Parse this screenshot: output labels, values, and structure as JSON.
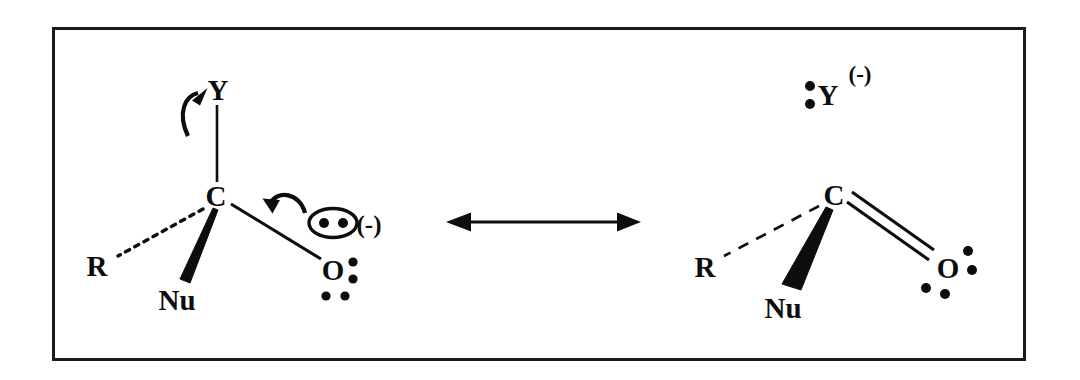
{
  "figure": {
    "background_color": "#ffffff",
    "ink_color": "#0d0d0d",
    "frame": {
      "name": "figure-border",
      "x": 52,
      "y": 27,
      "width": 974,
      "height": 334,
      "stroke_color": "#1a1a1a"
    },
    "resonance_arrow": {
      "name": "resonance-double-arrow",
      "symbol": "double-headed-arrow",
      "x1": 446,
      "y1": 222,
      "x2": 640,
      "y2": 222
    },
    "structures": [
      {
        "id": "left",
        "name": "tetrahedral-intermediate",
        "atoms": [
          {
            "label": "Y",
            "name": "atom-y",
            "x": 218,
            "y": 92
          },
          {
            "label": "C",
            "name": "atom-c",
            "x": 216,
            "y": 198
          },
          {
            "label": "R",
            "name": "atom-r",
            "x": 97,
            "y": 266
          },
          {
            "label": "Nu",
            "name": "atom-nu",
            "x": 177,
            "y": 300
          },
          {
            "label": "O",
            "name": "atom-o",
            "x": 333,
            "y": 270
          }
        ],
        "charges": [
          {
            "label": "(-)",
            "name": "charge-negative-lone-pair",
            "x": 369,
            "y": 232
          }
        ],
        "bonds": [
          {
            "name": "bond-c-y",
            "type": "plain",
            "from": "C",
            "to": "Y"
          },
          {
            "name": "bond-c-r",
            "type": "dotted",
            "from": "C",
            "to": "R"
          },
          {
            "name": "bond-c-nu",
            "type": "wedge",
            "from": "C",
            "to": "Nu"
          },
          {
            "name": "bond-c-o",
            "type": "plain",
            "from": "C",
            "to": "O"
          }
        ],
        "lone_pairs": [
          {
            "name": "lone-pair-o-right",
            "on": "O",
            "position": "right",
            "dots": 2
          },
          {
            "name": "lone-pair-o-below",
            "on": "O",
            "position": "below",
            "dots": 2
          },
          {
            "name": "lone-pair-circled",
            "on": "O",
            "position": "upper-right-circled",
            "dots": 2,
            "circled": true
          }
        ],
        "curved_arrows": [
          {
            "name": "curved-arrow-o-to-c",
            "from": "circled-lone-pair",
            "to": "c-o-bond",
            "direction": "down-left"
          },
          {
            "name": "curved-arrow-c-to-y",
            "from": "c-y-bond",
            "to": "y-leaving-group",
            "direction": "up-right"
          }
        ]
      },
      {
        "id": "right",
        "name": "carbonyl-product-with-leaving-group-anion",
        "atoms": [
          {
            "label": "Y",
            "name": "atom-y",
            "x": 828,
            "y": 97
          },
          {
            "label": "C",
            "name": "atom-c",
            "x": 834,
            "y": 197
          },
          {
            "label": "R",
            "name": "atom-r",
            "x": 705,
            "y": 267
          },
          {
            "label": "Nu",
            "name": "atom-nu",
            "x": 783,
            "y": 308
          },
          {
            "label": "O",
            "name": "atom-o",
            "x": 948,
            "y": 268
          }
        ],
        "charges": [
          {
            "label": "(-)",
            "name": "charge-negative-y",
            "x": 848,
            "y": 74
          }
        ],
        "bonds": [
          {
            "name": "bond-c-r",
            "type": "dashed",
            "from": "C",
            "to": "R"
          },
          {
            "name": "bond-c-nu",
            "type": "wedge",
            "from": "C",
            "to": "Nu"
          },
          {
            "name": "bond-c-o",
            "type": "double",
            "from": "C",
            "to": "O"
          }
        ],
        "lone_pairs": [
          {
            "name": "lone-pair-y-left",
            "on": "Y",
            "position": "left",
            "dots": 2
          },
          {
            "name": "lone-pair-o-right",
            "on": "O",
            "position": "right",
            "dots": 2
          },
          {
            "name": "lone-pair-o-below",
            "on": "O",
            "position": "below",
            "dots": 2
          }
        ],
        "curved_arrows": []
      }
    ]
  }
}
